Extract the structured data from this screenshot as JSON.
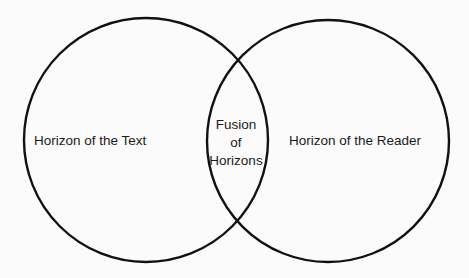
{
  "diagram": {
    "type": "venn",
    "stroke_color": "#111111",
    "background_color": "#fbfbfb",
    "sets": [
      {
        "id": "text",
        "label": "Horizon of the Text",
        "cx": 146,
        "cy": 140,
        "r": 122
      },
      {
        "id": "reader",
        "label": "Horizon of the Reader",
        "cx": 328,
        "cy": 141,
        "r": 121
      }
    ],
    "intersection": {
      "label_lines": [
        "Fusion",
        "of",
        "Horizons"
      ],
      "label": "Fusion of Horizons"
    }
  }
}
